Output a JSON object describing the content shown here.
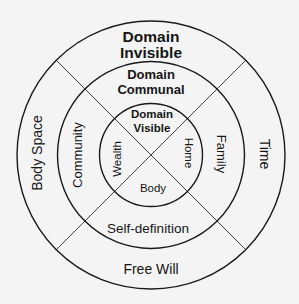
{
  "diagram": {
    "rings": {
      "outer": {
        "title_line1": "Domain",
        "title_line2": "Invisible",
        "left": "Body Space",
        "right": "Time",
        "bottom": "Free Will"
      },
      "middle": {
        "title_line1": "Domain",
        "title_line2": "Communal",
        "left": "Community",
        "right": "Family",
        "bottom": "Self-definition"
      },
      "inner": {
        "title_line1": "Domain",
        "title_line2": "Visible",
        "left": "Wealth",
        "right": "Home",
        "bottom": "Body"
      }
    },
    "colors": {
      "background": "#f4f4f4",
      "stroke": "#1a1a1a",
      "text": "#161616"
    }
  }
}
